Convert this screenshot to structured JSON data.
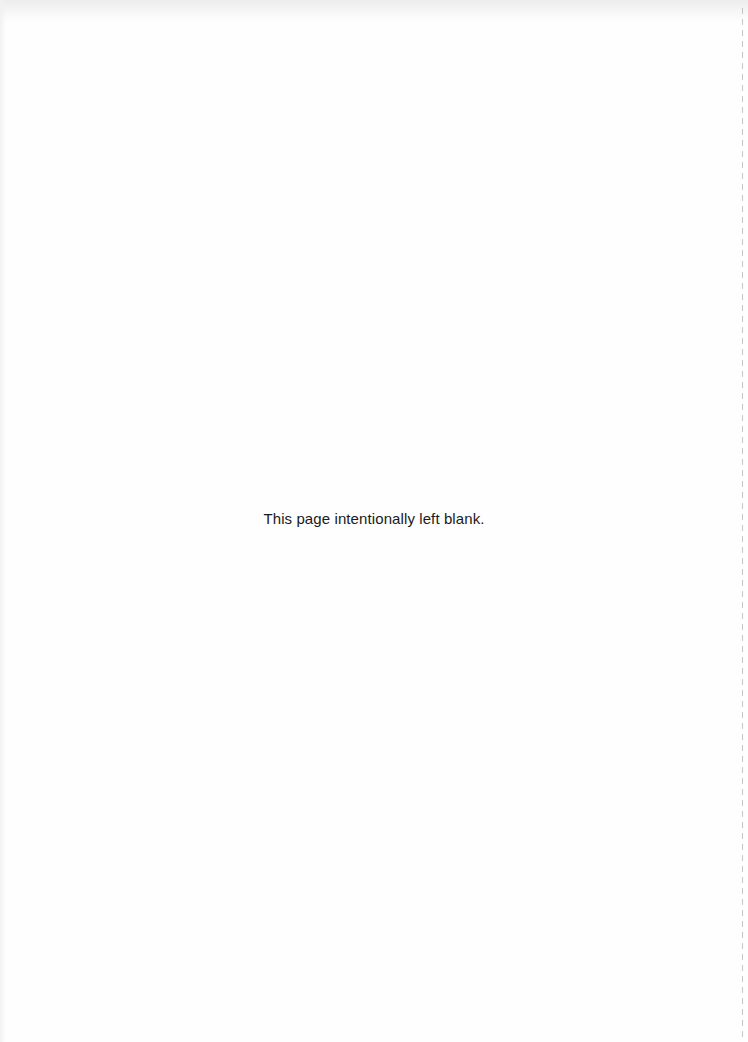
{
  "page": {
    "notice_text": "This page intentionally left blank."
  },
  "colors": {
    "background": "#fefefe",
    "text": "#1a1a1a",
    "edge_line": "#b8b8b8"
  }
}
